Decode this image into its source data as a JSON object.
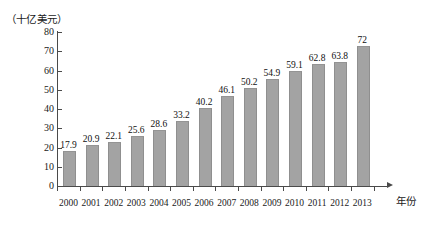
{
  "chart_data": {
    "type": "bar",
    "title": "（十亿美元）",
    "xlabel": "年份",
    "ylabel": "",
    "categories": [
      "2000",
      "2001",
      "2002",
      "2003",
      "2004",
      "2005",
      "2006",
      "2007",
      "2008",
      "2009",
      "2010",
      "2011",
      "2012",
      "2013"
    ],
    "values": [
      17.9,
      20.9,
      22.1,
      25.6,
      28.6,
      33.2,
      40.2,
      46.1,
      50.2,
      54.9,
      59.1,
      62.8,
      63.8,
      72
    ],
    "value_labels": [
      "17.9",
      "20.9",
      "22.1",
      "25.6",
      "28.6",
      "33.2",
      "40.2",
      "46.1",
      "50.2",
      "54.9",
      "59.1",
      "62.8",
      "63.8",
      "72"
    ],
    "ylim": [
      0,
      80
    ],
    "ytick_values": [
      0,
      10,
      20,
      30,
      40,
      50,
      60,
      70,
      80
    ],
    "ytick_labels": [
      "0",
      "10",
      "20",
      "30",
      "40",
      "50",
      "60",
      "70",
      "80"
    ],
    "grid": false,
    "legend": false,
    "bar_color": "#a3a3a3",
    "axis_color": "#4a4a4a",
    "text_color": "#1a1a1a"
  }
}
